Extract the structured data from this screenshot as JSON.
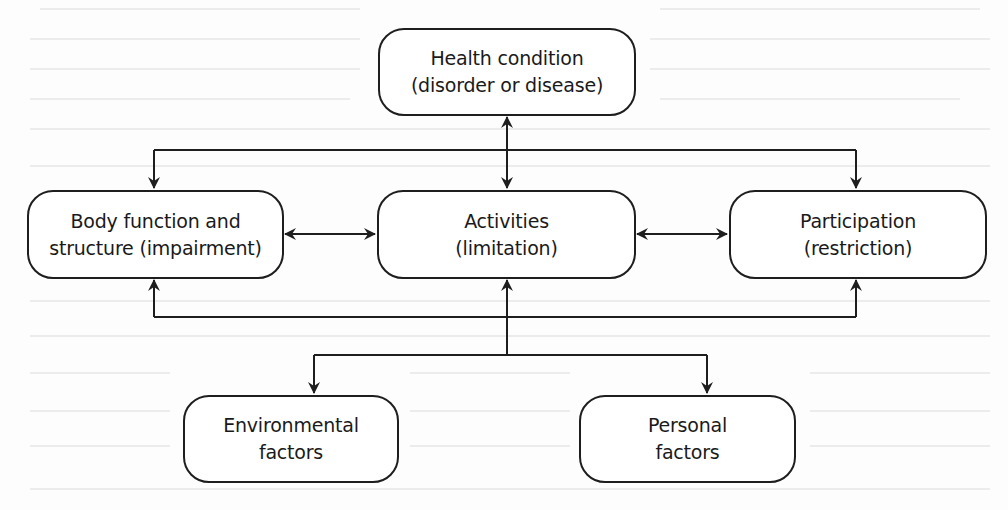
{
  "diagram": {
    "type": "flow",
    "nodes": {
      "health_condition": {
        "line1": "Health condition",
        "line2": "(disorder or disease)"
      },
      "body_function": {
        "line1": "Body function and",
        "line2": "structure (impairment)"
      },
      "activities": {
        "line1": "Activities",
        "line2": "(limitation)"
      },
      "participation": {
        "line1": "Participation",
        "line2": "(restriction)"
      },
      "environmental": {
        "line1": "Environmental",
        "line2": "factors"
      },
      "personal": {
        "line1": "Personal",
        "line2": "factors"
      }
    },
    "edges": [
      {
        "from": "health_condition",
        "to": "activities",
        "direction": "both"
      },
      {
        "from": "health_condition",
        "to": "body_function",
        "direction": "to"
      },
      {
        "from": "health_condition",
        "to": "participation",
        "direction": "to"
      },
      {
        "from": "body_function",
        "to": "activities",
        "direction": "both"
      },
      {
        "from": "activities",
        "to": "participation",
        "direction": "both"
      },
      {
        "from": "activities",
        "to": "environmental",
        "direction": "to"
      },
      {
        "from": "activities",
        "to": "personal",
        "direction": "to"
      },
      {
        "from": "environmental_personal_bus",
        "to": "body_function",
        "direction": "to"
      },
      {
        "from": "environmental_personal_bus",
        "to": "activities",
        "direction": "to"
      },
      {
        "from": "environmental_personal_bus",
        "to": "participation",
        "direction": "to"
      }
    ],
    "colors": {
      "stroke": "#1e1e1e",
      "background": "#ffffff"
    }
  }
}
